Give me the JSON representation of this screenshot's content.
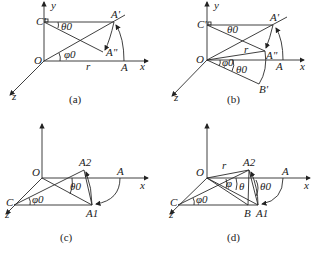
{
  "figure": {
    "panels": [
      {
        "id": "a",
        "caption": "(a)",
        "labels": {
          "y": "y",
          "x": "x",
          "z": "z",
          "origin": "O",
          "c_prime": "C'",
          "a_prime": "A'",
          "a_dprime": "A\"",
          "a": "A",
          "r": "r",
          "theta": "θ0",
          "phi": "φ0"
        }
      },
      {
        "id": "b",
        "caption": "(b)",
        "labels": {
          "y": "y",
          "x": "x",
          "z": "z",
          "origin": "O",
          "c_prime": "C'",
          "a_prime": "A'",
          "a_dprime": "A\"",
          "a": "A",
          "b_prime": "B'",
          "r": "r",
          "theta": "θ0",
          "phi": "φ0",
          "theta2": "θ0"
        }
      },
      {
        "id": "c",
        "caption": "(c)",
        "labels": {
          "y": "y",
          "x": "x",
          "z": "z",
          "origin": "O",
          "c": "C",
          "a": "A",
          "a1": "A1",
          "a2": "A2",
          "theta": "θ0",
          "phi": "φ0"
        }
      },
      {
        "id": "d",
        "caption": "(d)",
        "labels": {
          "y": "y",
          "x": "x",
          "z": "z",
          "origin": "O",
          "c": "C",
          "a": "A",
          "a1": "A1",
          "a2": "A2",
          "b": "B",
          "r": "r",
          "theta": "θ",
          "theta0": "θ0",
          "phi": "φ",
          "phi0": "φ0"
        }
      }
    ]
  }
}
